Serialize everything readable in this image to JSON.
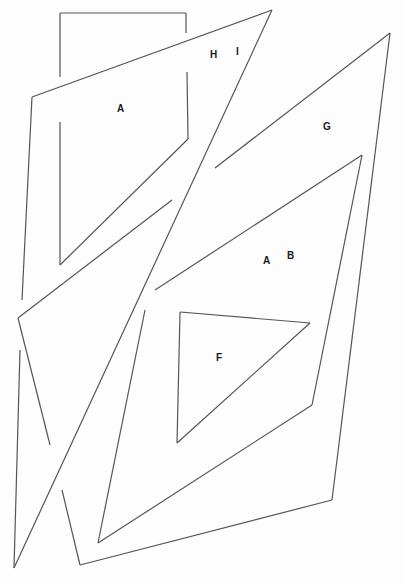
{
  "diagram": {
    "type": "line-drawing",
    "stroke_color": "#555555",
    "background": "#fdfdfd",
    "labels": [
      {
        "text": "A",
        "x": 117,
        "y": 104
      },
      {
        "text": "H",
        "x": 210,
        "y": 50
      },
      {
        "text": "I",
        "x": 236,
        "y": 47
      },
      {
        "text": "G",
        "x": 323,
        "y": 122
      },
      {
        "text": "A",
        "x": 263,
        "y": 256
      },
      {
        "text": "B",
        "x": 287,
        "y": 251
      },
      {
        "text": "F",
        "x": 216,
        "y": 353
      }
    ],
    "segments": [
      [
        60,
        13,
        186,
        13
      ],
      [
        60,
        13,
        60,
        77
      ],
      [
        186,
        13,
        186,
        33
      ],
      [
        272,
        10,
        32,
        97
      ],
      [
        32,
        97,
        22,
        300
      ],
      [
        60,
        122,
        60,
        265
      ],
      [
        187,
        72,
        188,
        139
      ],
      [
        188,
        139,
        60,
        265
      ],
      [
        272,
        10,
        14,
        568
      ],
      [
        390,
        33,
        215,
        168
      ],
      [
        390,
        33,
        332,
        500
      ],
      [
        332,
        500,
        80,
        565
      ],
      [
        80,
        565,
        62,
        490
      ],
      [
        362,
        155,
        155,
        290
      ],
      [
        362,
        155,
        312,
        405
      ],
      [
        312,
        405,
        98,
        543
      ],
      [
        98,
        543,
        145,
        310
      ],
      [
        172,
        200,
        18,
        318
      ],
      [
        18,
        318,
        50,
        445
      ],
      [
        20,
        350,
        14,
        568
      ],
      [
        180,
        312,
        310,
        323
      ],
      [
        310,
        323,
        177,
        443
      ],
      [
        177,
        443,
        180,
        312
      ]
    ]
  }
}
